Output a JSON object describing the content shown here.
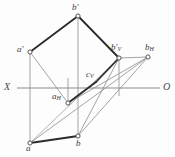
{
  "figure": {
    "type": "descriptive-geometry-monge-projection",
    "canvas": {
      "width": 175,
      "height": 157
    },
    "background_color": "#fdfdfd",
    "colors": {
      "heavy_line": "#2b2b2b",
      "light_line": "#9a9a9a",
      "axis_line": "#8c8c8c",
      "vertex_stroke": "#555555",
      "vertex_fill": "#ffffff",
      "label_color": "#3a3a3a"
    },
    "axis": {
      "left_label": "X",
      "right_label": "O",
      "y": 88,
      "x_start": 17,
      "x_end": 160
    },
    "points": [
      {
        "id": "b-prime",
        "label": "b",
        "sub": "",
        "prime": true,
        "x": 78,
        "y": 16,
        "label_x": 72,
        "label_y": 3
      },
      {
        "id": "a-prime",
        "label": "a",
        "sub": "",
        "prime": true,
        "x": 30,
        "y": 52,
        "label_x": 17,
        "label_y": 45
      },
      {
        "id": "b-prime-v",
        "label": "b",
        "sub": "V",
        "prime": true,
        "x": 119,
        "y": 58,
        "label_x": 113,
        "label_y": 44
      },
      {
        "id": "b-h",
        "label": "b",
        "sub": "H",
        "prime": false,
        "x": 148,
        "y": 57,
        "label_x": 146,
        "label_y": 44
      },
      {
        "id": "c-v",
        "label": "c",
        "sub": "V",
        "prime": false,
        "x": 96,
        "y": 82,
        "label_x": 86,
        "label_y": 70
      },
      {
        "id": "a-h",
        "label": "a",
        "sub": "H",
        "prime": false,
        "x": 68,
        "y": 103,
        "label_x": 53,
        "label_y": 92
      },
      {
        "id": "a",
        "label": "a",
        "sub": "",
        "prime": false,
        "x": 30,
        "y": 143,
        "label_x": 27,
        "label_y": 145
      },
      {
        "id": "b",
        "label": "b",
        "sub": "",
        "prime": false,
        "x": 78,
        "y": 136,
        "label_x": 77,
        "label_y": 140
      }
    ],
    "heavy_edges": [
      {
        "name": "aprime-to-bprime",
        "from": "a-prime",
        "to": "b-prime"
      },
      {
        "name": "bprime-to-bprimev",
        "from": "b-prime",
        "to": "b-prime-v"
      },
      {
        "name": "bprimev-to-cv",
        "from": "b-prime-v",
        "to": "c-v"
      },
      {
        "name": "cv-to-ah",
        "from": "c-v",
        "to": "a-h"
      },
      {
        "name": "a-to-b",
        "from": "a",
        "to": "b"
      }
    ],
    "light_edges": [
      {
        "name": "aprime-vertical",
        "from": "a-prime",
        "to": "a"
      },
      {
        "name": "bprime-vertical",
        "from": "b-prime",
        "to": "b"
      },
      {
        "name": "bprimev-vertical",
        "from": "b-prime-v",
        "to": "axis-drop-v"
      },
      {
        "name": "ah-vertical-up",
        "from": "a-h",
        "to": "ah-axis-top"
      },
      {
        "name": "aprime-to-ah",
        "from": "a-prime",
        "to": "a-h"
      },
      {
        "name": "a-to-bh",
        "from": "a",
        "to": "b-h"
      },
      {
        "name": "ah-to-bh",
        "from": "a-h",
        "to": "b-h"
      },
      {
        "name": "b-to-bh",
        "from": "b",
        "to": "b-h"
      },
      {
        "name": "bprimev-to-bh",
        "from": "b-prime-v",
        "to": "b-h"
      },
      {
        "name": "bprimev-to-b",
        "from": "b-prime-v",
        "to": "b"
      }
    ]
  }
}
